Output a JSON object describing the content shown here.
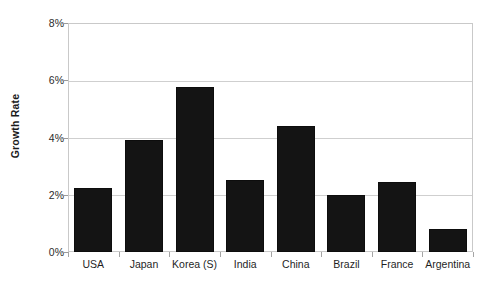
{
  "chart_data": {
    "type": "bar",
    "title": "",
    "subtitle": "",
    "xlabel": "",
    "ylabel": "Growth Rate",
    "categories": [
      "USA",
      "Japan",
      "Korea (S)",
      "India",
      "China",
      "Brazil",
      "France",
      "Argentina"
    ],
    "values": [
      2.25,
      3.9,
      5.75,
      2.5,
      4.4,
      2.0,
      2.45,
      0.8
    ],
    "series": [
      {
        "name": "Growth Rate",
        "values": [
          2.25,
          3.9,
          5.75,
          2.5,
          4.4,
          2.0,
          2.45,
          0.8
        ]
      }
    ],
    "ylim": [
      0,
      8
    ],
    "ytick_values": [
      0,
      2,
      4,
      6,
      8
    ],
    "ytick_labels": [
      "0%",
      "2%",
      "4%",
      "6%",
      "8%"
    ],
    "grid": true,
    "grid_axis": "y",
    "legend": false,
    "legend_position": "none",
    "bar_color": "#141414",
    "grid_color": "#cfcfcf",
    "axis_color": "#c9c9c9",
    "value_unit": "%"
  },
  "axes": {
    "y_title": "Growth Rate"
  }
}
